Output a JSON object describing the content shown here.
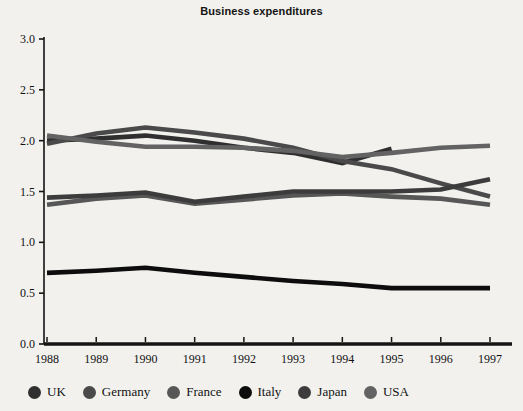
{
  "chart_data": {
    "type": "line",
    "title": "Business expenditures",
    "xlabel": "",
    "ylabel": "",
    "x": [
      "1988",
      "1989",
      "1990",
      "1991",
      "1992",
      "1993",
      "1994",
      "1995",
      "1996",
      "1997"
    ],
    "ylim": [
      0.0,
      3.0
    ],
    "ytick_labels": [
      "0.0",
      "0.5",
      "1.0",
      "1.5",
      "2.0",
      "2.5",
      "3.0"
    ],
    "ytick_values": [
      0.0,
      0.5,
      1.0,
      1.5,
      2.0,
      2.5,
      3.0
    ],
    "grid": false,
    "legend_position": "bottom",
    "series": [
      {
        "name": "UK",
        "color": "#2f2f2f",
        "values": [
          2.0,
          2.02,
          2.05,
          2.0,
          1.93,
          1.88,
          1.78,
          1.92,
          null,
          null
        ]
      },
      {
        "name": "Germany",
        "color": "#4a4a4a",
        "values": [
          1.97,
          2.07,
          2.13,
          2.08,
          2.02,
          1.93,
          1.8,
          1.72,
          1.58,
          1.45
        ]
      },
      {
        "name": "France",
        "color": "#575757",
        "values": [
          1.37,
          1.43,
          1.46,
          1.38,
          1.42,
          1.46,
          1.48,
          1.45,
          1.43,
          1.37
        ]
      },
      {
        "name": "Italy",
        "color": "#0d0d0d",
        "values": [
          0.7,
          0.72,
          0.75,
          0.7,
          0.66,
          0.62,
          0.59,
          0.55,
          0.55,
          0.55
        ]
      },
      {
        "name": "Japan",
        "color": "#3c3c3c",
        "values": [
          1.44,
          1.46,
          1.49,
          1.4,
          1.45,
          1.5,
          1.5,
          1.5,
          1.52,
          1.62
        ]
      },
      {
        "name": "USA",
        "color": "#636363",
        "values": [
          2.05,
          1.99,
          1.94,
          1.94,
          1.93,
          1.9,
          1.84,
          1.88,
          1.93,
          1.95
        ]
      }
    ]
  },
  "legend": {
    "items": [
      {
        "label": "UK"
      },
      {
        "label": "Germany"
      },
      {
        "label": "France"
      },
      {
        "label": "Italy"
      },
      {
        "label": "Japan"
      },
      {
        "label": "USA"
      }
    ]
  }
}
